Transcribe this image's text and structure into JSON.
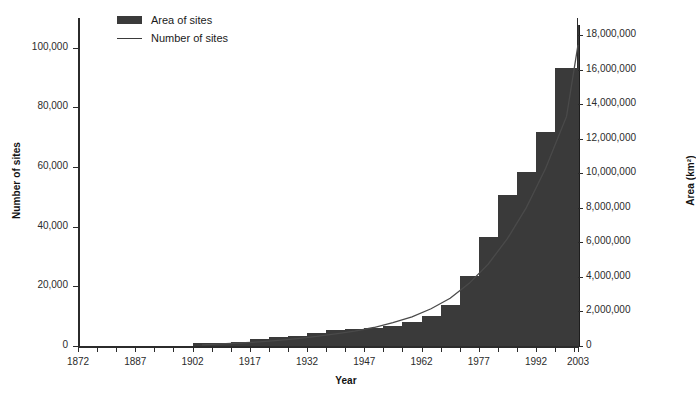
{
  "chart_data": {
    "type": "bar",
    "title": "",
    "xlabel": "Year",
    "ylabel": "Number of sites",
    "y2label": "Area (km²)",
    "grid": false,
    "legend_position": "top-left",
    "legend": [
      {
        "label": "Area of sites",
        "marker": "bar",
        "color": "#3a3a3a"
      },
      {
        "label": "Number of sites",
        "marker": "line",
        "color": "#3a3a3a"
      }
    ],
    "x_tick_labels": [
      "1872",
      "1887",
      "1902",
      "1917",
      "1932",
      "1947",
      "1962",
      "1977",
      "1992",
      "2003"
    ],
    "x_tick_years": [
      1872,
      1887,
      1902,
      1917,
      1932,
      1947,
      1962,
      1977,
      1992,
      2003
    ],
    "xlim": [
      1872,
      2003
    ],
    "ylim": [
      0,
      110000
    ],
    "y2lim": [
      0,
      19000000
    ],
    "y_tick_labels": [
      "0",
      "20,000",
      "40,000",
      "60,000",
      "80,000",
      "100,000"
    ],
    "y_tick_values": [
      0,
      20000,
      40000,
      60000,
      80000,
      100000
    ],
    "y2_tick_labels": [
      "0",
      "2,000,000",
      "4,000,000",
      "6,000,000",
      "8,000,000",
      "10,000,000",
      "12,000,000",
      "14,000,000",
      "16,000,000",
      "18,000,000"
    ],
    "y2_tick_values": [
      0,
      2000000,
      4000000,
      6000000,
      8000000,
      10000000,
      12000000,
      14000000,
      16000000,
      18000000
    ],
    "bin_width_years": 5,
    "categories": [
      "1872",
      "1877",
      "1882",
      "1887",
      "1892",
      "1897",
      "1902",
      "1907",
      "1912",
      "1917",
      "1922",
      "1927",
      "1932",
      "1937",
      "1942",
      "1947",
      "1952",
      "1957",
      "1962",
      "1967",
      "1972",
      "1977",
      "1982",
      "1987",
      "1992",
      "1997",
      "2003"
    ],
    "series": [
      {
        "name": "Area of sites",
        "axis": "right",
        "unit": "km²",
        "values": [
          0,
          0,
          0,
          0,
          0,
          0,
          150000,
          200000,
          250000,
          400000,
          500000,
          600000,
          750000,
          900000,
          1000000,
          1050000,
          1150000,
          1400000,
          1750000,
          2400000,
          4050000,
          6300000,
          8750000,
          10100000,
          12400000,
          16100000,
          18600000
        ]
      },
      {
        "name": "Number of sites",
        "axis": "left",
        "unit": "sites",
        "values": [
          0,
          0,
          0,
          0,
          0,
          0,
          400,
          700,
          1000,
          1400,
          1900,
          2500,
          3200,
          4100,
          5000,
          6200,
          7800,
          9800,
          12500,
          16000,
          21000,
          27500,
          36000,
          46500,
          59500,
          77000,
          101000
        ]
      }
    ]
  }
}
